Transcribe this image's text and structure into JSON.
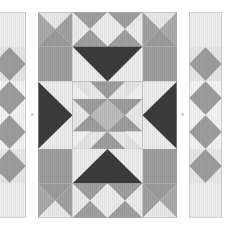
{
  "artwork": {
    "title": "Three-Panel Geometric Quilt Study",
    "type": "quilt-pattern-triptych",
    "canvas": {
      "width": 228,
      "height": 230,
      "background": "#ffffff"
    },
    "palette": {
      "dark": "#3c3c3c",
      "medium": "#9d9d9d",
      "medium_light": "#b8b8b8",
      "light": "#ececec",
      "offwhite": "#f4f4f4",
      "outline": "#a8a8a8",
      "pin": "#b9b9b9"
    },
    "panels": [
      {
        "name": "left-panel",
        "label": "Left Border Strip",
        "x": -7,
        "y": 12,
        "width": 33,
        "height": 206,
        "cropped": true,
        "bands": [
          {
            "kind": "plain",
            "fill": "light",
            "height_ratio": 0.17
          },
          {
            "kind": "diamond-chain",
            "count": 4,
            "fill_a": "medium",
            "fill_b": "light",
            "height_ratio": 0.66
          },
          {
            "kind": "plain",
            "fill": "light",
            "height_ratio": 0.17
          }
        ]
      },
      {
        "name": "center-panel",
        "label": "Center Medallion Block",
        "x": 38,
        "y": 12,
        "width": 139,
        "height": 206,
        "cropped": false,
        "grid": {
          "cols": 4,
          "rows": 5
        },
        "regions": [
          {
            "kind": "hourglass-row",
            "position": "top",
            "blocks": 4
          },
          {
            "kind": "flying-geese",
            "position": "top",
            "fill": "dark"
          },
          {
            "kind": "flying-geese",
            "position": "left",
            "fill": "dark"
          },
          {
            "kind": "flying-geese",
            "position": "right",
            "fill": "dark"
          },
          {
            "kind": "flying-geese",
            "position": "bottom",
            "fill": "dark"
          },
          {
            "kind": "eight-point-star",
            "position": "center",
            "point_fill": "light",
            "ground_fill": "medium",
            "core_fill": "medium_light"
          },
          {
            "kind": "hourglass-row",
            "position": "bottom",
            "blocks": 4
          }
        ]
      },
      {
        "name": "right-panel",
        "label": "Right Border Strip",
        "x": 189,
        "y": 12,
        "width": 33,
        "height": 206,
        "cropped": false,
        "bands": [
          {
            "kind": "plain",
            "fill": "light",
            "height_ratio": 0.17
          },
          {
            "kind": "diamond-chain",
            "count": 4,
            "fill_a": "medium",
            "fill_b": "light",
            "height_ratio": 0.66
          },
          {
            "kind": "plain",
            "fill": "light",
            "height_ratio": 0.17
          }
        ]
      }
    ],
    "markers": [
      {
        "name": "pin-left",
        "x": 31,
        "y": 113
      },
      {
        "name": "pin-right",
        "x": 181,
        "y": 113
      }
    ]
  },
  "chart_data": {
    "type": "heatmap",
    "categories": [
      "left-panel",
      "center-panel",
      "right-panel"
    ],
    "series": [
      {
        "name": "dark",
        "values": [
          0,
          18,
          0
        ]
      },
      {
        "name": "medium",
        "values": [
          34,
          31,
          34
        ]
      },
      {
        "name": "medium_light",
        "values": [
          0,
          6,
          0
        ]
      },
      {
        "name": "light",
        "values": [
          66,
          45,
          66
        ]
      }
    ],
    "xlabel": "panel",
    "ylabel": "tone coverage (%)",
    "legend": [
      "dark",
      "medium",
      "medium_light",
      "light"
    ],
    "grid": false
  }
}
